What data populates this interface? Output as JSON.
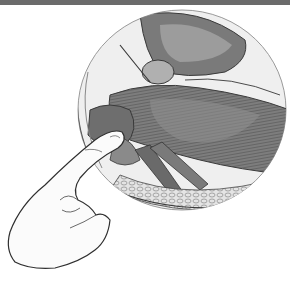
{
  "figure": {
    "colors": {
      "top_bar": "#6b6b6b",
      "background": "#ffffff",
      "circle_fill": "#efefef",
      "tissue_dark": "#5f5f5f",
      "tissue_mid": "#8a8a8a",
      "tissue_light": "#b5b5b5",
      "outline": "#3a3a3a",
      "hand_fill": "#fbfbfb"
    }
  }
}
